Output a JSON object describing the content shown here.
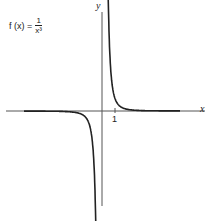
{
  "chart_data": {
    "type": "line",
    "formula": {
      "lhs": "f (x) =",
      "numerator": "1",
      "denominator": "x³"
    },
    "xlabel": "x",
    "ylabel": "y",
    "x_ticks": [
      "1"
    ],
    "grid": false,
    "legend": null,
    "series": [
      {
        "name": "f(x)=1/x^3 (x>0)",
        "x": [
          0.55,
          0.6,
          0.7,
          0.8,
          1.0,
          1.5,
          2,
          3,
          5
        ],
        "y": [
          6.0,
          4.6,
          2.9,
          1.95,
          1.0,
          0.3,
          0.125,
          0.037,
          0.008
        ]
      },
      {
        "name": "f(x)=1/x^3 (x<0)",
        "x": [
          -7,
          -5,
          -3,
          -2,
          -1.5,
          -1.0,
          -0.8,
          -0.7,
          -0.6
        ],
        "y": [
          -0.003,
          -0.008,
          -0.037,
          -0.125,
          -0.3,
          -1.0,
          -1.95,
          -2.9,
          -4.6
        ]
      }
    ]
  }
}
